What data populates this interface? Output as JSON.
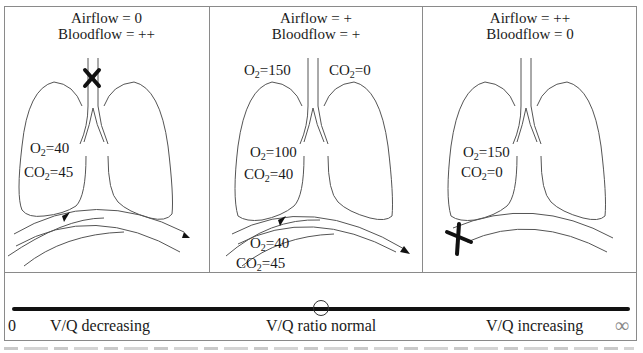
{
  "panels": [
    {
      "id": "low-vq",
      "title_line1": "Airflow = 0",
      "title_line2": "Bloodflow = ++",
      "airway_blocked": true,
      "blood_blocked": false,
      "alveolar": {
        "o2_label": "O",
        "o2_sub": "2",
        "o2_value": "=40",
        "co2_label": "CO",
        "co2_sub": "2",
        "co2_value": "=45"
      }
    },
    {
      "id": "normal-vq",
      "title_line1": "Airflow = +",
      "title_line2": "Bloodflow = +",
      "airway_blocked": false,
      "blood_blocked": false,
      "inspired": {
        "o2_label": "O",
        "o2_sub": "2",
        "o2_value": "=150",
        "co2_label": "CO",
        "co2_sub": "2",
        "co2_value": "=0"
      },
      "alveolar": {
        "o2_label": "O",
        "o2_sub": "2",
        "o2_value": "=100",
        "co2_label": "CO",
        "co2_sub": "2",
        "co2_value": "=40"
      },
      "venous": {
        "o2_label": "O",
        "o2_sub": "2",
        "o2_value": "=40",
        "co2_label": "CO",
        "co2_sub": "2",
        "co2_value": "=45"
      }
    },
    {
      "id": "high-vq",
      "title_line1": "Airflow = ++",
      "title_line2": "Bloodflow = 0",
      "airway_blocked": false,
      "blood_blocked": true,
      "alveolar": {
        "o2_label": "O",
        "o2_sub": "2",
        "o2_value": "=150",
        "co2_label": "CO",
        "co2_sub": "2",
        "co2_value": "=0"
      }
    }
  ],
  "scale": {
    "left_end": "0",
    "left_label": "V/Q decreasing",
    "center_label": "V/Q ratio normal",
    "right_label": "V/Q increasing",
    "right_end": "∞"
  },
  "colors": {
    "line": "#555555",
    "frame": "#8a8a8a",
    "bar": "#111111",
    "block_mark": "#111111"
  }
}
